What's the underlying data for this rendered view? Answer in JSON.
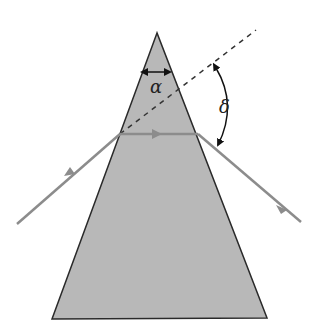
{
  "diagram": {
    "type": "prism-refraction",
    "labels": {
      "apex_angle": "α",
      "deviation_angle": "δ"
    },
    "colors": {
      "prism_fill": "#b8b8b8",
      "prism_edge": "#2a2a2a",
      "ray": "#8c8c8c",
      "dashed": "#333333",
      "arrow": "#111111"
    }
  }
}
